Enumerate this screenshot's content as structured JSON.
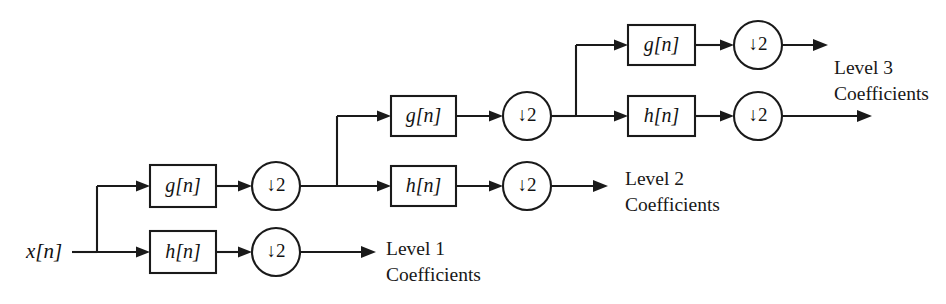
{
  "diagram": {
    "input": {
      "label": "x[n]",
      "name": "input-signal"
    },
    "filters": {
      "highpass_label": "g[n]",
      "lowpass_label": "h[n]"
    },
    "downsampler": {
      "label": "↓2"
    },
    "stages": [
      {
        "stage": 1,
        "g_label": "g[n]",
        "h_label": "h[n]",
        "g_down_label": "↓2",
        "h_down_label": "↓2",
        "output_label_line1": "Level 1",
        "output_label_line2": "Coefficients"
      },
      {
        "stage": 2,
        "g_label": "g[n]",
        "h_label": "h[n]",
        "g_down_label": "↓2",
        "h_down_label": "↓2",
        "output_label_line1": "Level 2",
        "output_label_line2": "Coefficients"
      },
      {
        "stage": 3,
        "g_label": "g[n]",
        "h_label": "h[n]",
        "g_down_label": "↓2",
        "h_down_label": "↓2",
        "output_label_line1": "Level 3",
        "output_label_line2": "Coefficients"
      }
    ],
    "colors": {
      "line": "#1a1a1a",
      "text": "#121212",
      "background": "#ffffff",
      "block_fill": "#ffffff"
    }
  }
}
